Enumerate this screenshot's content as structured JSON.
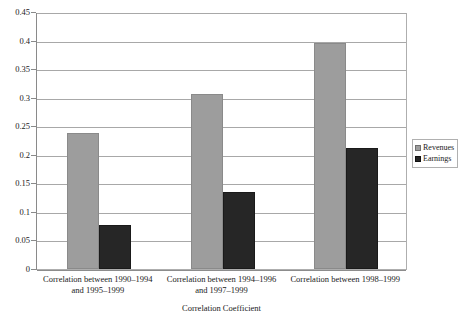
{
  "chart_data": {
    "type": "bar",
    "title": "",
    "xlabel": "Correlation Coefficient",
    "ylabel": "",
    "ylim": [
      0,
      0.45
    ],
    "grid": true,
    "legend_position": "right",
    "categories": [
      "Correlation between 1990–1994 and 1995–1999",
      "Correlation between 1994–1996 and 1997–1999",
      "Correlation between 1998–1999"
    ],
    "category_lines": [
      [
        "Correlation between 1990–1994",
        "and 1995–1999"
      ],
      [
        "Correlation between 1994–1996",
        "and 1997–1999"
      ],
      [
        "Correlation between 1998–1999"
      ]
    ],
    "series": [
      {
        "name": "Revenues",
        "color": "#9d9d9d",
        "values": [
          0.239,
          0.307,
          0.395
        ]
      },
      {
        "name": "Earnings",
        "color": "#262626",
        "values": [
          0.077,
          0.135,
          0.212
        ]
      }
    ],
    "yticks": [
      0,
      0.05,
      0.1,
      0.15,
      0.2,
      0.25,
      0.3,
      0.35,
      0.4,
      0.45
    ],
    "ytick_labels": [
      "0",
      "0.05",
      "0.1",
      "0.15",
      "0.2",
      "0.25",
      "0.3",
      "0.35",
      "0.4",
      "0.45"
    ]
  },
  "legend": {
    "items": [
      {
        "label": "Revenues"
      },
      {
        "label": "Earnings"
      }
    ]
  },
  "axis": {
    "x_title": "Correlation Coefficient"
  }
}
